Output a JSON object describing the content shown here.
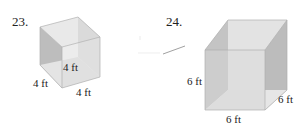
{
  "problems": [
    {
      "number": "23.",
      "shape": "cube",
      "labels": {
        "height": "4 ft",
        "depth": "4 ft",
        "width": "4 ft"
      }
    },
    {
      "number": "24.",
      "shape": "cube",
      "labels": {
        "height": "6 ft",
        "depth": "6 ft",
        "width": "6 ft"
      }
    }
  ],
  "colors": {
    "face_dark": "#b9b9b9",
    "face_mid": "#cfcfcf",
    "face_light": "#e6e6e6",
    "edge": "#a8a8a8"
  }
}
